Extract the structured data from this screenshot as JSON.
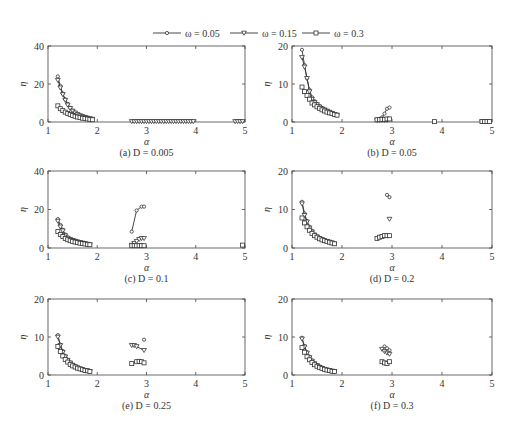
{
  "legend": {
    "items": [
      {
        "label": "ω = 0.05",
        "marker": "circle"
      },
      {
        "label": "ω = 0.15",
        "marker": "triangle-down"
      },
      {
        "label": "ω = 0.3",
        "marker": "square"
      }
    ]
  },
  "chart_data": [
    {
      "type": "line",
      "caption": "(a) D = 0.005",
      "xlabel": "α",
      "ylabel": "η",
      "xlim": [
        1,
        5
      ],
      "ylim": [
        0,
        40
      ],
      "xticks": [
        1,
        2,
        3,
        4,
        5
      ],
      "yticks": [
        0,
        20,
        40
      ],
      "grid": false,
      "series": [
        {
          "name": "ω = 0.05",
          "x": [
            1.2,
            1.25,
            1.3,
            1.35,
            1.4,
            1.45,
            1.5,
            1.55,
            1.6,
            1.65,
            1.7,
            1.75,
            1.8,
            1.85,
            1.9
          ],
          "y": [
            24,
            19,
            15,
            12,
            9.5,
            7.5,
            6,
            5,
            4.2,
            3.5,
            3,
            2.6,
            2.2,
            1.9,
            1.6
          ]
        },
        {
          "name": "ω = 0.15",
          "x": [
            1.2,
            1.25,
            1.3,
            1.35,
            1.4,
            1.45,
            1.5,
            1.55,
            1.6,
            1.65,
            1.7,
            1.75,
            1.8,
            1.85,
            1.9,
            2.7,
            2.75,
            2.8,
            2.85,
            2.9,
            2.95,
            3.0,
            3.05,
            3.1,
            3.15,
            3.2,
            3.25,
            3.3,
            3.35,
            3.4,
            3.45,
            3.5,
            3.55,
            3.6,
            3.65,
            3.7,
            3.75,
            3.8,
            3.85,
            3.9,
            3.95,
            4.8,
            4.85,
            4.9,
            4.95
          ],
          "y": [
            22,
            18,
            14.5,
            11.5,
            9,
            7.2,
            5.8,
            4.8,
            4,
            3.4,
            2.9,
            2.5,
            2.1,
            1.8,
            1.5,
            0.3,
            0.3,
            0.3,
            0.3,
            0.3,
            0.3,
            0.3,
            0.3,
            0.3,
            0.3,
            0.3,
            0.3,
            0.3,
            0.3,
            0.3,
            0.3,
            0.3,
            0.3,
            0.3,
            0.3,
            0.3,
            0.3,
            0.3,
            0.3,
            0.3,
            0.3,
            0.3,
            0.3,
            0.3,
            0.3
          ]
        },
        {
          "name": "ω = 0.3",
          "x": [
            1.2,
            1.25,
            1.3,
            1.35,
            1.4,
            1.45,
            1.5,
            1.55,
            1.6,
            1.65,
            1.7,
            1.75,
            1.8,
            1.85,
            1.9
          ],
          "y": [
            8.5,
            7,
            6,
            5.2,
            4.5,
            3.9,
            3.4,
            3,
            2.6,
            2.3,
            2,
            1.8,
            1.6,
            1.4,
            1.2
          ]
        }
      ]
    },
    {
      "type": "line",
      "caption": "(b) D = 0.05",
      "xlabel": "α",
      "ylabel": "η",
      "xlim": [
        1,
        5
      ],
      "ylim": [
        0,
        20
      ],
      "xticks": [
        1,
        2,
        3,
        4,
        5
      ],
      "yticks": [
        0,
        10,
        20
      ],
      "grid": false,
      "series": [
        {
          "name": "ω = 0.05",
          "x": [
            1.2,
            1.25,
            1.3,
            1.35,
            1.4,
            1.45,
            1.5,
            1.55,
            1.6,
            1.65,
            1.7,
            1.75,
            1.8,
            1.85,
            1.9,
            2.7,
            2.75,
            2.8,
            2.85,
            2.9,
            2.95
          ],
          "y": [
            19,
            15,
            11.5,
            8.5,
            6.5,
            5.5,
            4.8,
            4.2,
            3.7,
            3.3,
            3,
            2.7,
            2.4,
            2.1,
            1.9,
            0.6,
            0.8,
            1.2,
            2.2,
            3.5,
            3.8
          ]
        },
        {
          "name": "ω = 0.15",
          "x": [
            1.2,
            1.25,
            1.3,
            1.35,
            1.4,
            1.45,
            1.5,
            1.55,
            1.6,
            1.65,
            1.7,
            1.75,
            1.8,
            1.85,
            1.9,
            2.7,
            2.75,
            2.8,
            2.85,
            2.9,
            4.8,
            4.85,
            4.9,
            4.95
          ],
          "y": [
            17,
            14.5,
            11.5,
            8,
            6,
            5.2,
            4.6,
            4,
            3.5,
            3.2,
            2.9,
            2.6,
            2.3,
            2,
            1.8,
            0.5,
            0.5,
            0.5,
            0.5,
            0.5,
            0.1,
            0.1,
            0.1,
            0.1
          ]
        },
        {
          "name": "ω = 0.3",
          "x": [
            1.2,
            1.25,
            1.3,
            1.35,
            1.4,
            1.45,
            1.5,
            1.55,
            1.6,
            1.65,
            1.7,
            1.75,
            1.8,
            1.85,
            1.9,
            2.7,
            2.75,
            2.8,
            2.85,
            2.9,
            2.95,
            3.85,
            4.8,
            4.85,
            4.9,
            4.95
          ],
          "y": [
            9.2,
            8,
            7,
            6,
            5,
            4.5,
            4,
            3.6,
            3.2,
            2.9,
            2.6,
            2.4,
            2.2,
            2,
            1.8,
            0.6,
            0.6,
            0.7,
            0.7,
            0.8,
            0.8,
            0.1,
            0.1,
            0.1,
            0.1,
            0.1
          ]
        }
      ]
    },
    {
      "type": "line",
      "caption": "(c) D = 0.1",
      "xlabel": "α",
      "ylabel": "η",
      "xlim": [
        1,
        5
      ],
      "ylim": [
        0,
        40
      ],
      "xticks": [
        1,
        2,
        3,
        4,
        5
      ],
      "yticks": [
        0,
        20,
        40
      ],
      "grid": false,
      "series": [
        {
          "name": "ω = 0.05",
          "x": [
            1.2,
            1.25,
            1.3,
            1.35,
            1.4,
            1.45,
            1.5,
            1.55,
            1.6,
            1.65,
            1.7,
            1.75,
            1.8,
            1.85,
            2.7,
            2.8,
            2.9,
            2.95
          ],
          "y": [
            15,
            12,
            9.5,
            7,
            5.5,
            4.8,
            4.2,
            3.8,
            3.4,
            3,
            2.7,
            2.4,
            2.1,
            1.8,
            8.5,
            19.5,
            21.5,
            21.5
          ]
        },
        {
          "name": "ω = 0.15",
          "x": [
            1.2,
            1.25,
            1.3,
            1.35,
            1.4,
            1.45,
            1.5,
            1.55,
            1.6,
            1.65,
            1.7,
            1.75,
            1.8,
            1.85,
            2.7,
            2.75,
            2.8,
            2.85,
            2.9,
            2.95
          ],
          "y": [
            14,
            11,
            9,
            6.5,
            5.2,
            4.5,
            4,
            3.6,
            3.2,
            2.9,
            2.6,
            2.3,
            2,
            1.7,
            1.5,
            2.5,
            3.5,
            4.5,
            5,
            5
          ]
        },
        {
          "name": "ω = 0.3",
          "x": [
            1.2,
            1.25,
            1.3,
            1.35,
            1.4,
            1.45,
            1.5,
            1.55,
            1.6,
            1.65,
            1.7,
            1.75,
            1.8,
            1.85,
            2.7,
            2.75,
            2.8,
            2.85,
            2.9,
            2.95,
            4.95
          ],
          "y": [
            8.5,
            7,
            6,
            5,
            4.3,
            3.8,
            3.4,
            3.1,
            2.8,
            2.5,
            2.3,
            2.1,
            1.9,
            1.7,
            1.2,
            1.2,
            1.2,
            1.2,
            1.2,
            1.2,
            1.5
          ]
        }
      ]
    },
    {
      "type": "line",
      "caption": "(d) D = 0.2",
      "xlabel": "α",
      "ylabel": "η",
      "xlim": [
        1,
        5
      ],
      "ylim": [
        0,
        20
      ],
      "xticks": [
        1,
        2,
        3,
        4,
        5
      ],
      "yticks": [
        0,
        10,
        20
      ],
      "grid": false,
      "series": [
        {
          "name": "ω = 0.05",
          "x": [
            1.2,
            1.25,
            1.3,
            1.35,
            1.4,
            1.45,
            1.5,
            1.55,
            1.6,
            1.65,
            1.7,
            1.75,
            1.8,
            1.85,
            2.9,
            2.95
          ],
          "y": [
            12,
            9,
            7,
            5.5,
            4.5,
            3.5,
            3,
            2.6,
            2.3,
            2,
            1.8,
            1.6,
            1.4,
            1.2,
            13.8,
            13.2
          ]
        },
        {
          "name": "ω = 0.15",
          "x": [
            1.2,
            1.25,
            1.3,
            1.35,
            1.4,
            1.45,
            1.5,
            1.55,
            1.6,
            1.65,
            1.7,
            1.75,
            1.8,
            1.85,
            2.95
          ],
          "y": [
            11.5,
            8.5,
            6.8,
            5.2,
            4.2,
            3.4,
            2.9,
            2.5,
            2.2,
            1.9,
            1.7,
            1.5,
            1.3,
            1.1,
            7.5
          ]
        },
        {
          "name": "ω = 0.3",
          "x": [
            1.2,
            1.25,
            1.3,
            1.35,
            1.4,
            1.45,
            1.5,
            1.55,
            1.6,
            1.65,
            1.7,
            1.75,
            1.8,
            1.85,
            2.7,
            2.75,
            2.8,
            2.85,
            2.9,
            2.95
          ],
          "y": [
            7.8,
            6.5,
            5.5,
            4.6,
            3.8,
            3.2,
            2.8,
            2.4,
            2.1,
            1.9,
            1.7,
            1.5,
            1.3,
            1.1,
            2.5,
            2.8,
            3,
            3.2,
            3.2,
            3.2
          ]
        }
      ]
    },
    {
      "type": "line",
      "caption": "(e) D = 0.25",
      "xlabel": "α",
      "ylabel": "η",
      "xlim": [
        1,
        5
      ],
      "ylim": [
        0,
        20
      ],
      "xticks": [
        1,
        2,
        3,
        4,
        5
      ],
      "yticks": [
        0,
        10,
        20
      ],
      "grid": false,
      "series": [
        {
          "name": "ω = 0.05",
          "x": [
            1.2,
            1.25,
            1.3,
            1.35,
            1.4,
            1.45,
            1.5,
            1.55,
            1.6,
            1.65,
            1.7,
            1.75,
            1.8,
            1.85,
            2.95
          ],
          "y": [
            10.5,
            8,
            6.3,
            5,
            4,
            3.3,
            2.7,
            2.3,
            2,
            1.7,
            1.5,
            1.3,
            1.1,
            1,
            9.3
          ]
        },
        {
          "name": "ω = 0.15",
          "x": [
            1.2,
            1.25,
            1.3,
            1.35,
            1.4,
            1.45,
            1.5,
            1.55,
            1.6,
            1.65,
            1.7,
            1.75,
            1.8,
            1.85,
            2.7,
            2.75,
            2.8,
            2.95
          ],
          "y": [
            10,
            7.8,
            6,
            4.8,
            3.9,
            3.2,
            2.6,
            2.2,
            1.9,
            1.6,
            1.4,
            1.2,
            1.1,
            0.9,
            7.8,
            7.8,
            7.5,
            6.5
          ]
        },
        {
          "name": "ω = 0.3",
          "x": [
            1.2,
            1.25,
            1.3,
            1.35,
            1.4,
            1.45,
            1.5,
            1.55,
            1.6,
            1.65,
            1.7,
            1.75,
            1.8,
            1.85,
            2.7,
            2.8,
            2.85,
            2.9,
            2.95
          ],
          "y": [
            7.5,
            6.2,
            5,
            4.1,
            3.4,
            2.8,
            2.4,
            2.1,
            1.8,
            1.6,
            1.4,
            1.2,
            1.1,
            0.9,
            3,
            3.5,
            3.6,
            3.5,
            3.2
          ]
        }
      ]
    },
    {
      "type": "line",
      "caption": "(f) D = 0.3",
      "xlabel": "α",
      "ylabel": "η",
      "xlim": [
        1,
        5
      ],
      "ylim": [
        0,
        20
      ],
      "xticks": [
        1,
        2,
        3,
        4,
        5
      ],
      "yticks": [
        0,
        10,
        20
      ],
      "grid": false,
      "series": [
        {
          "name": "ω = 0.05",
          "x": [
            1.2,
            1.25,
            1.3,
            1.35,
            1.4,
            1.45,
            1.5,
            1.55,
            1.6,
            1.65,
            1.7,
            1.75,
            1.8,
            1.85,
            2.85,
            2.9,
            2.95
          ],
          "y": [
            9.8,
            7.6,
            6,
            4.8,
            3.8,
            3.1,
            2.6,
            2.2,
            1.9,
            1.6,
            1.4,
            1.2,
            1.1,
            1,
            7.5,
            7,
            6.5
          ]
        },
        {
          "name": "ω = 0.15",
          "x": [
            1.2,
            1.25,
            1.3,
            1.35,
            1.4,
            1.45,
            1.5,
            1.55,
            1.6,
            1.65,
            1.7,
            1.75,
            1.8,
            1.85,
            2.8,
            2.85,
            2.9,
            2.95
          ],
          "y": [
            9.5,
            7.4,
            5.8,
            4.6,
            3.7,
            3,
            2.5,
            2.1,
            1.8,
            1.5,
            1.3,
            1.2,
            1,
            0.9,
            6.8,
            6.2,
            5.8,
            5.5
          ]
        },
        {
          "name": "ω = 0.3",
          "x": [
            1.2,
            1.25,
            1.3,
            1.35,
            1.4,
            1.45,
            1.5,
            1.55,
            1.6,
            1.65,
            1.7,
            1.75,
            1.8,
            1.85,
            2.8,
            2.85,
            2.9,
            2.95
          ],
          "y": [
            7.2,
            6,
            4.8,
            4,
            3.3,
            2.7,
            2.3,
            2,
            1.7,
            1.5,
            1.3,
            1.2,
            1,
            0.9,
            3.5,
            3.2,
            3,
            3.5
          ]
        }
      ]
    }
  ],
  "layout": {
    "panels": [
      {
        "left": 48,
        "top": 46,
        "width": 197,
        "height": 76
      },
      {
        "left": 292,
        "top": 46,
        "width": 200,
        "height": 76
      },
      {
        "left": 48,
        "top": 171,
        "width": 197,
        "height": 77
      },
      {
        "left": 292,
        "top": 171,
        "width": 200,
        "height": 77
      },
      {
        "left": 48,
        "top": 299,
        "width": 197,
        "height": 76
      },
      {
        "left": 292,
        "top": 299,
        "width": 200,
        "height": 76
      }
    ],
    "line_color": "#333333",
    "marker_fill": "#ffffff"
  }
}
